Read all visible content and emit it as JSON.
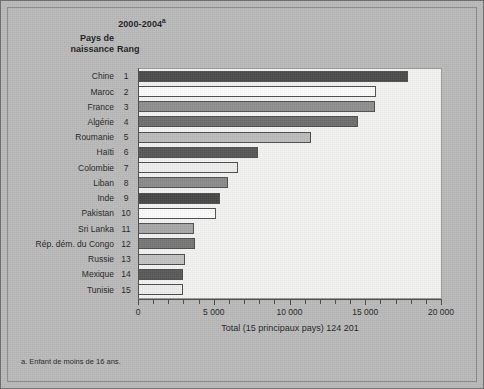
{
  "figure": {
    "period_label": "2000-2004",
    "period_superscript": "a",
    "column_header_country": "Pays de naissance",
    "column_header_rank": "Rang",
    "footnote": "a. Enfant de moins de 16 ans.",
    "background_color": "#b9b9b9",
    "plot_background_color": "#f2f2f0",
    "axis_color": "#4a4a4a"
  },
  "chart_data": {
    "type": "bar",
    "orientation": "horizontal",
    "title": "2000-2004",
    "xlabel": "Total (15 principaux pays) 124 201",
    "ylabel": "Pays de naissance",
    "xlim": [
      0,
      20000
    ],
    "xticks": [
      0,
      5000,
      10000,
      15000,
      20000
    ],
    "xtick_labels": [
      "0",
      "5 000",
      "10 000",
      "15 000",
      "20 000"
    ],
    "minor_tick_interval": 1000,
    "grid": false,
    "legend": "none",
    "total_label": "Total (15 principaux pays) 124 201",
    "total_value": 124201,
    "categories": [
      "Chine",
      "Maroc",
      "France",
      "Algérie",
      "Roumanie",
      "Haïti",
      "Colombie",
      "Liban",
      "Inde",
      "Pakistan",
      "Sri Lanka",
      "Rép. dém. du Congo",
      "Russie",
      "Mexique",
      "Tunisie"
    ],
    "ranks": [
      1,
      2,
      3,
      4,
      5,
      6,
      7,
      8,
      9,
      10,
      11,
      12,
      13,
      14,
      15
    ],
    "values": [
      17850,
      15700,
      15620,
      14490,
      11390,
      7930,
      6590,
      5960,
      5390,
      5160,
      3690,
      3760,
      3125,
      2945,
      2970
    ],
    "bar_colors": [
      "#4a4a4a",
      "#fbfbfb",
      "#8e8e8e",
      "#6d6d6d",
      "#bcbcbc",
      "#565656",
      "#ededed",
      "#8a8a8a",
      "#454545",
      "#fbfbfb",
      "#a6a6a6",
      "#757575",
      "#c2c2c2",
      "#585858",
      "#ededed"
    ]
  }
}
